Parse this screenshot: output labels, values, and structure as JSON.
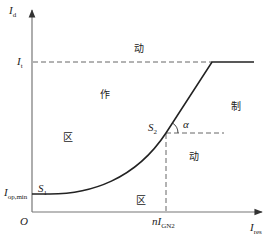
{
  "diagram": {
    "type": "ratio-restraint differential protection characteristic",
    "colors": {
      "axis": "#555555",
      "curve": "#222222",
      "dashed": "#555555",
      "text": "#222222"
    },
    "axes": {
      "y_label": {
        "main": "I",
        "sub": "d"
      },
      "x_label": {
        "main": "I",
        "sub": "res"
      },
      "origin": "O"
    },
    "y_ticks": {
      "it": {
        "main": "I",
        "sub": "t"
      },
      "iop_min": {
        "main": "I",
        "sub": "op,min"
      }
    },
    "x_ticks": {
      "n_ign2": {
        "prefix": "n",
        "main": "I",
        "sub": "GN2"
      }
    },
    "points": {
      "s1": {
        "main": "S",
        "sub": "1"
      },
      "s2": {
        "main": "S",
        "sub": "2"
      }
    },
    "angle_label": "α",
    "region_labels": {
      "dong_top": "动",
      "zuo": "作",
      "qu_left": "区",
      "zhi": "制",
      "dong_right": "动",
      "qu_bottom": "区"
    }
  }
}
